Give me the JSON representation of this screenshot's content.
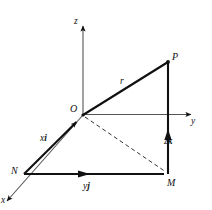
{
  "figure": {
    "kind": "3d-vector-position-diagram",
    "background_color": "#ffffff",
    "line_color": "#111111",
    "axes": [
      {
        "id": "z",
        "label": "z",
        "direction": "up",
        "arrow": true
      },
      {
        "id": "y",
        "label": "y",
        "direction": "right",
        "arrow": true
      },
      {
        "id": "x",
        "label": "x",
        "direction": "down-left",
        "arrow": true
      }
    ],
    "points": [
      {
        "id": "O",
        "label": "O",
        "x": 83,
        "y": 115
      },
      {
        "id": "P",
        "label": "P",
        "x": 168,
        "y": 62
      },
      {
        "id": "M",
        "label": "M",
        "x": 168,
        "y": 174
      },
      {
        "id": "N",
        "label": "N",
        "x": 24,
        "y": 174
      }
    ],
    "vectors": [
      {
        "id": "r",
        "label": "r",
        "label_html": "r",
        "from": "O",
        "to": "P",
        "style": "solid",
        "arrow": false
      },
      {
        "id": "xi",
        "label": "xi",
        "label_html": "x<b>i</b>",
        "from": "N",
        "to": "O",
        "style": "solid",
        "arrow": true
      },
      {
        "id": "yj",
        "label": "yj",
        "label_html": "y<b>j</b>",
        "from": "N",
        "to": "M",
        "style": "solid",
        "arrow": true
      },
      {
        "id": "zk",
        "label": "zk",
        "label_html": "z<b>k</b>",
        "from": "M",
        "to": "P",
        "style": "solid",
        "arrow": true
      },
      {
        "id": "OM",
        "label": "",
        "label_html": "",
        "from": "O",
        "to": "M",
        "style": "dashed",
        "arrow": false
      }
    ],
    "labels": {
      "z_axis": "z",
      "y_axis": "y",
      "x_axis": "x",
      "origin": "O",
      "point_p": "P",
      "point_m": "M",
      "point_n": "N",
      "vector_r": "r",
      "component_x": "x",
      "component_x_unit": "i",
      "component_y": "y",
      "component_y_unit": "j",
      "component_z": "z",
      "component_z_unit": "k"
    }
  }
}
